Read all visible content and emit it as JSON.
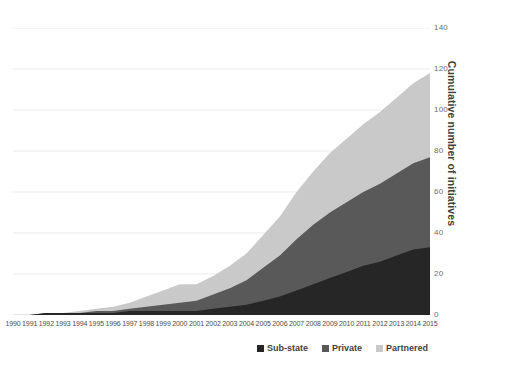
{
  "chart_data": {
    "type": "area",
    "stacked": true,
    "title": "",
    "subtitle": "",
    "xlabel": "",
    "ylabel": "Cumulative number of initiatives",
    "ylim": [
      0,
      140
    ],
    "ytick_step": 20,
    "yticks": [
      0,
      20,
      40,
      60,
      80,
      100,
      120,
      140
    ],
    "ytick_labels": [
      "0",
      "20",
      "40",
      "60",
      "80",
      "100",
      "120",
      "140"
    ],
    "grid": true,
    "grid_axis": "y",
    "legend_position": "bottom-right",
    "y_axis_side": "right",
    "categories": [
      "1990",
      "1991",
      "1992",
      "1993",
      "1994",
      "1995",
      "1996",
      "1997",
      "1998",
      "1999",
      "2000",
      "2001",
      "2002",
      "2003",
      "2004",
      "2005",
      "2006",
      "2007",
      "2008",
      "2009",
      "2010",
      "2011",
      "2012",
      "2013",
      "2014",
      "2015"
    ],
    "series": [
      {
        "name": "Sub-state",
        "color": "#262626",
        "values": [
          0,
          0,
          1,
          1,
          1,
          1,
          1,
          2,
          2,
          2,
          2,
          2,
          3,
          4,
          5,
          7,
          9,
          12,
          15,
          18,
          21,
          24,
          26,
          29,
          32,
          33
        ]
      },
      {
        "name": "Private",
        "color": "#595959",
        "values": [
          0,
          0,
          0,
          0,
          0,
          1,
          1,
          1,
          2,
          3,
          4,
          5,
          7,
          9,
          12,
          16,
          20,
          25,
          29,
          32,
          34,
          36,
          38,
          40,
          42,
          44
        ]
      },
      {
        "name": "Partnered",
        "color": "#c9c9c9",
        "values": [
          0,
          0,
          0,
          0,
          1,
          1,
          2,
          3,
          5,
          7,
          9,
          8,
          9,
          11,
          13,
          16,
          19,
          23,
          26,
          29,
          31,
          33,
          35,
          37,
          39,
          41
        ]
      }
    ],
    "totals": [
      0,
      0,
      1,
      1,
      2,
      3,
      4,
      6,
      9,
      12,
      15,
      15,
      19,
      24,
      30,
      39,
      48,
      60,
      70,
      79,
      86,
      93,
      99,
      106,
      113,
      118
    ]
  },
  "legend": {
    "items": [
      {
        "label": "Sub-state",
        "color": "#262626"
      },
      {
        "label": "Private",
        "color": "#595959"
      },
      {
        "label": "Partnered",
        "color": "#c9c9c9"
      }
    ]
  }
}
